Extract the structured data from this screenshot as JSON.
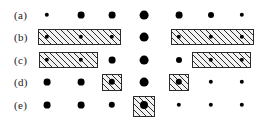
{
  "figure": {
    "width": 258,
    "height": 126,
    "background_color": "#ffffff",
    "dot_color": "#000000",
    "box_border_color": "#2b2b2b",
    "box_fill_color": "#f2f2f2",
    "hatch_color": "#2b2b2b"
  },
  "columns_x": [
    47,
    81,
    112,
    144,
    179,
    211,
    242
  ],
  "rows": [
    {
      "label": "(a)",
      "label_x": 14,
      "y": 15,
      "dots": [
        {
          "cx": 47,
          "r": 2.2
        },
        {
          "cx": 81,
          "r": 3.4
        },
        {
          "cx": 112,
          "r": 3.4
        },
        {
          "cx": 144,
          "r": 4.4
        },
        {
          "cx": 179,
          "r": 3.4
        },
        {
          "cx": 211,
          "r": 3.0
        },
        {
          "cx": 242,
          "r": 2.2
        }
      ],
      "boxes": []
    },
    {
      "label": "(b)",
      "label_x": 14,
      "y": 37,
      "dots": [
        {
          "cx": 47,
          "r": 2.2
        },
        {
          "cx": 81,
          "r": 2.2
        },
        {
          "cx": 112,
          "r": 2.2
        },
        {
          "cx": 144,
          "r": 4.4
        },
        {
          "cx": 179,
          "r": 2.2
        },
        {
          "cx": 211,
          "r": 2.2
        },
        {
          "cx": 242,
          "r": 2.2
        }
      ],
      "boxes": [
        {
          "x": 38,
          "y": 29,
          "w": 83,
          "h": 16
        },
        {
          "x": 171,
          "y": 29,
          "w": 83,
          "h": 16
        }
      ]
    },
    {
      "label": "(c)",
      "label_x": 14,
      "y": 60,
      "dots": [
        {
          "cx": 47,
          "r": 2.2
        },
        {
          "cx": 81,
          "r": 2.2
        },
        {
          "cx": 112,
          "r": 3.4
        },
        {
          "cx": 144,
          "r": 4.4
        },
        {
          "cx": 179,
          "r": 3.0
        },
        {
          "cx": 211,
          "r": 2.2
        },
        {
          "cx": 242,
          "r": 2.2
        }
      ],
      "boxes": [
        {
          "x": 39,
          "y": 52,
          "w": 59,
          "h": 16
        },
        {
          "x": 192,
          "y": 52,
          "w": 59,
          "h": 16
        }
      ]
    },
    {
      "label": "(d)",
      "label_x": 14,
      "y": 82,
      "dots": [
        {
          "cx": 47,
          "r": 3.4
        },
        {
          "cx": 81,
          "r": 3.4
        },
        {
          "cx": 112,
          "r": 3.2
        },
        {
          "cx": 144,
          "r": 4.4
        },
        {
          "cx": 179,
          "r": 3.2
        },
        {
          "cx": 211,
          "r": 2.2
        },
        {
          "cx": 242,
          "r": 2.2
        }
      ],
      "boxes": [
        {
          "x": 102,
          "y": 74,
          "w": 20,
          "h": 17
        },
        {
          "x": 169,
          "y": 74,
          "w": 20,
          "h": 17
        }
      ]
    },
    {
      "label": "(e)",
      "label_x": 14,
      "y": 105,
      "dots": [
        {
          "cx": 47,
          "r": 3.4
        },
        {
          "cx": 81,
          "r": 3.4
        },
        {
          "cx": 112,
          "r": 3.2
        },
        {
          "cx": 144,
          "r": 4.0
        },
        {
          "cx": 179,
          "r": 2.2
        },
        {
          "cx": 211,
          "r": 2.2
        },
        {
          "cx": 242,
          "r": 2.2
        }
      ],
      "boxes": [
        {
          "x": 133,
          "y": 96,
          "w": 22,
          "h": 21
        }
      ]
    }
  ]
}
